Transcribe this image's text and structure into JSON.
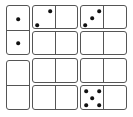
{
  "puzzle": {
    "type": "domino-grid",
    "colors": {
      "border": "#555555",
      "pip": "#111111",
      "background": "#ffffff"
    },
    "dominoes": [
      {
        "id": "d1",
        "orientation": "vertical",
        "column": 1,
        "row": 1,
        "halves": [
          1,
          1
        ]
      },
      {
        "id": "d2",
        "orientation": "vertical",
        "column": 1,
        "row": 2,
        "halves": [
          0,
          0
        ]
      },
      {
        "id": "d3",
        "orientation": "horizontal",
        "column": 2,
        "row": 1,
        "halves": [
          2,
          0
        ]
      },
      {
        "id": "d4",
        "orientation": "horizontal",
        "column": 2,
        "row": 2,
        "halves": [
          0,
          0
        ]
      },
      {
        "id": "d5",
        "orientation": "horizontal",
        "column": 2,
        "row": 3,
        "halves": [
          0,
          0
        ]
      },
      {
        "id": "d6",
        "orientation": "horizontal",
        "column": 2,
        "row": 4,
        "halves": [
          0,
          0
        ]
      },
      {
        "id": "d7",
        "orientation": "horizontal",
        "column": 3,
        "row": 1,
        "halves": [
          3,
          0
        ]
      },
      {
        "id": "d8",
        "orientation": "horizontal",
        "column": 3,
        "row": 2,
        "halves": [
          0,
          0
        ]
      },
      {
        "id": "d9",
        "orientation": "horizontal",
        "column": 3,
        "row": 3,
        "halves": [
          0,
          0
        ]
      },
      {
        "id": "d10",
        "orientation": "horizontal",
        "column": 3,
        "row": 4,
        "halves": [
          5,
          0
        ]
      }
    ]
  }
}
